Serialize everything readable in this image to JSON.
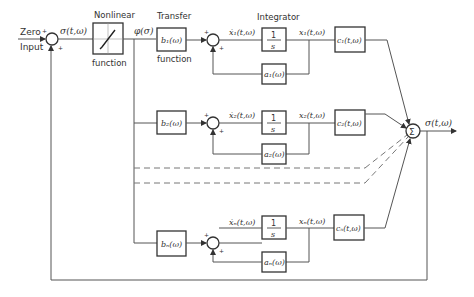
{
  "input": {
    "label_line1": "Zero",
    "label_line2": "Input"
  },
  "signals": {
    "sigma": "σ(t,ω)",
    "phi": "φ(σ)",
    "output": "σ(t,ω)"
  },
  "nonlinear": {
    "title": "Nonlinear",
    "subtitle": "function"
  },
  "transfer": {
    "title": "Transfer",
    "subtitle": "function"
  },
  "integrator_title": "Integrator",
  "rows": [
    {
      "b": "b₁(ω)",
      "xdot": "ẋ₁(t,ω)",
      "integ": "1",
      "integ_s": "s",
      "x": "x₁(t,ω)",
      "a": "a₁(ω)",
      "c": "c₁(t,ω)"
    },
    {
      "b": "b₂(ω)",
      "xdot": "ẋ₂(t,ω)",
      "integ": "1",
      "integ_s": "s",
      "x": "x₂(t,ω)",
      "a": "a₂(ω)",
      "c": "c₂(t,ω)"
    },
    {
      "b": "bₙ(ω)",
      "xdot": "ẋₙ(t,ω)",
      "integ": "1",
      "integ_s": "s",
      "x": "xₙ(t,ω)",
      "a": "aₙ(ω)",
      "c": "cₙ(t,ω)"
    }
  ],
  "summation": {
    "symbol": "Σ"
  },
  "signs": {
    "plus": "+",
    "minus": "-"
  }
}
